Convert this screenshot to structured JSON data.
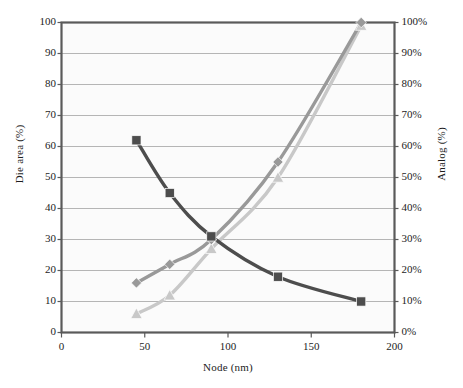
{
  "chart_data": {
    "type": "line",
    "title": "",
    "xlabel": "Node (nm)",
    "ylabel": "Die area (%)",
    "y2label": "Analog (%)",
    "xlim": [
      0,
      200
    ],
    "ylim": [
      0,
      100
    ],
    "y2lim": [
      0,
      100
    ],
    "xticks": [
      "0",
      "50",
      "100",
      "150",
      "200"
    ],
    "xtick_values": [
      0,
      50,
      100,
      150,
      200
    ],
    "yticks": [
      "0",
      "10",
      "20",
      "30",
      "40",
      "50",
      "60",
      "70",
      "80",
      "90",
      "100"
    ],
    "ytick_values": [
      0,
      10,
      20,
      30,
      40,
      50,
      60,
      70,
      80,
      90,
      100
    ],
    "y2ticks": [
      "0%",
      "10%",
      "20%",
      "30%",
      "40%",
      "50%",
      "60%",
      "70%",
      "80%",
      "90%",
      "100%"
    ],
    "y2tick_values": [
      0,
      10,
      20,
      30,
      40,
      50,
      60,
      70,
      80,
      90,
      100
    ],
    "grid": true,
    "grid_axis": "y",
    "legend": "none",
    "x": [
      45,
      65,
      90,
      130,
      180
    ],
    "series": [
      {
        "name": "Die area",
        "axis": "left",
        "marker": "square",
        "color": "#4d4d4d",
        "values": [
          62,
          45,
          31,
          18,
          10
        ]
      },
      {
        "name": "Analog (diamond)",
        "axis": "right",
        "marker": "diamond",
        "color": "#999999",
        "values": [
          16,
          22,
          30,
          55,
          100
        ]
      },
      {
        "name": "Analog (triangle)",
        "axis": "right",
        "marker": "triangle",
        "color": "#c8c8c8",
        "values": [
          6,
          12,
          27,
          50,
          99
        ]
      }
    ]
  },
  "figure": {
    "plot_bg": "#fbfbfb",
    "frame_color": "#5a5a5a",
    "grid_color": "#adadad",
    "text_color": "#1d1d1d",
    "caption_text": ""
  }
}
